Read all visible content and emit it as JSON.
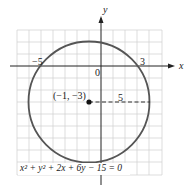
{
  "figure": {
    "equation": "x² + y² + 2x + 6y − 15 = 0",
    "center_label": "(−1, −3)",
    "radius_label": "5",
    "x_axis_label": "x",
    "y_axis_label": "y",
    "tick_labels": {
      "left_intercept": "−5",
      "right_intercept": "3",
      "origin": "0"
    },
    "center": {
      "x": -1,
      "y": -3
    },
    "radius": 5,
    "colors": {
      "circle": "#555555",
      "grid": "#cccccc",
      "axis": "#222222"
    }
  }
}
